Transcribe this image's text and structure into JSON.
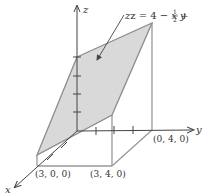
{
  "figure": {
    "type": "3d-surface-over-rectangle",
    "equation": {
      "prefix": "z = 4 − ",
      "x": "x",
      "plus": " + ",
      "frac_num": "1",
      "frac_den": "2",
      "y": "y"
    },
    "axes": {
      "x": "x",
      "y": "y",
      "z": "z"
    },
    "points": {
      "p300": "(3, 0, 0)",
      "p340": "(3, 4, 0)",
      "p040": "(0, 4, 0)"
    },
    "colors": {
      "plane_fill": "#d9d9d9",
      "plane_edge": "#8c8c8c",
      "box_edge": "#999999",
      "axis": "#444444",
      "text": "#333333"
    }
  }
}
